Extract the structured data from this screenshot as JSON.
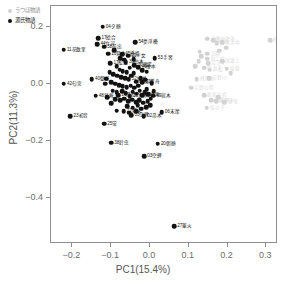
{
  "chart_data": {
    "type": "scatter",
    "title": "",
    "xlabel": "PC1(15.4%)",
    "ylabel": "PC2(11.3%)",
    "xlim": [
      -0.255,
      0.33
    ],
    "ylim": [
      -0.56,
      0.275
    ],
    "xticks": [
      -0.2,
      -0.1,
      0.0,
      0.1,
      0.2,
      0.3
    ],
    "xticklabels": [
      "−0.2",
      "−0.1",
      "0.0",
      "0.1",
      "0.2",
      "0.3"
    ],
    "yticks": [
      0.2,
      0.0,
      -0.2,
      -0.4
    ],
    "yticklabels": [
      "0.2",
      "0.0",
      "−0.2",
      "−0.4"
    ],
    "grid": false,
    "legend_position": "top-left",
    "series": [
      {
        "name": "うつほ物語",
        "color": "#d2d2d2",
        "marker": "circle",
        "points": [
          {
            "x": 0.148,
            "y": 0.16,
            "label": "内侍のかみ"
          },
          {
            "x": 0.163,
            "y": 0.155,
            "label": "楼の上上"
          },
          {
            "x": 0.172,
            "y": 0.145,
            "label": "楼の上中"
          },
          {
            "x": 0.186,
            "y": 0.148,
            "label": "吹上上"
          },
          {
            "x": 0.31,
            "y": 0.155,
            "label": "蔵開"
          },
          {
            "x": 0.148,
            "y": 0.108,
            "label": "正頥"
          },
          {
            "x": 0.148,
            "y": 0.09,
            "label": "吹上中"
          },
          {
            "x": 0.15,
            "y": 0.075,
            "label": "泣き子"
          },
          {
            "x": 0.186,
            "y": 0.082,
            "label": "国譲上"
          },
          {
            "x": 0.14,
            "y": 0.058,
            "label": "吹上下"
          },
          {
            "x": 0.154,
            "y": 0.052,
            "label": "浜松"
          },
          {
            "x": 0.198,
            "y": 0.055,
            "label": "俊蔭"
          },
          {
            "x": 0.12,
            "y": 0.018,
            "label": "蔵開上"
          },
          {
            "x": 0.152,
            "y": 0.022,
            "label": "吉野川"
          },
          {
            "x": 0.106,
            "y": -0.012,
            "label": "吉野の院"
          },
          {
            "x": 0.14,
            "y": -0.038,
            "label": "藤原の君"
          },
          {
            "x": 0.158,
            "y": -0.055,
            "label": "蔵開中"
          },
          {
            "x": 0.17,
            "y": -0.058,
            "label": "国譲下"
          },
          {
            "x": 0.192,
            "y": -0.062,
            "label": "継母"
          },
          {
            "x": 0.146,
            "y": -0.082,
            "label": "松の下"
          },
          {
            "x": 0.128,
            "y": 0.115,
            "label": ""
          },
          {
            "x": 0.132,
            "y": 0.098,
            "label": ""
          },
          {
            "x": 0.126,
            "y": 0.082,
            "label": ""
          },
          {
            "x": 0.116,
            "y": 0.064,
            "label": ""
          },
          {
            "x": 0.196,
            "y": 0.128,
            "label": ""
          },
          {
            "x": 0.178,
            "y": 0.118,
            "label": ""
          },
          {
            "x": 0.208,
            "y": 0.04,
            "label": ""
          },
          {
            "x": 0.176,
            "y": -0.044,
            "label": ""
          }
        ]
      },
      {
        "name": "源氏物語",
        "color": "#121212",
        "marker": "circle",
        "points": [
          {
            "x": -0.122,
            "y": 0.203,
            "label": "04夕顔",
            "pos": "right"
          },
          {
            "x": -0.133,
            "y": 0.163,
            "label": "17絵合",
            "pos": "right"
          },
          {
            "x": -0.136,
            "y": 0.14,
            "label": "44竹河",
            "pos": "right"
          },
          {
            "x": -0.118,
            "y": 0.132,
            "label": "58前出",
            "pos": "right"
          },
          {
            "x": -0.038,
            "y": 0.148,
            "label": "54夢浮橋",
            "pos": "right"
          },
          {
            "x": -0.222,
            "y": 0.122,
            "label": "11花散里",
            "pos": "right"
          },
          {
            "x": -0.108,
            "y": 0.108,
            "label": "10賢木",
            "pos": "right"
          },
          {
            "x": -0.072,
            "y": 0.105,
            "label": "45橋姫",
            "pos": "right"
          },
          {
            "x": -0.056,
            "y": 0.1,
            "label": "21少女",
            "pos": "right"
          },
          {
            "x": 0.012,
            "y": 0.092,
            "label": "53手習",
            "pos": "right"
          },
          {
            "x": -0.102,
            "y": 0.075,
            "label": "17松風",
            "pos": "right"
          },
          {
            "x": -0.062,
            "y": 0.078,
            "label": "36柏木",
            "pos": "right"
          },
          {
            "x": -0.04,
            "y": 0.068,
            "label": "30藤袋",
            "pos": "right"
          },
          {
            "x": -0.03,
            "y": 0.06,
            "label": "46椎本",
            "pos": "right"
          },
          {
            "x": -0.15,
            "y": 0.018,
            "label": "40御法",
            "pos": "right"
          },
          {
            "x": -0.222,
            "y": 0.002,
            "label": "42匂宮",
            "pos": "right"
          },
          {
            "x": -0.055,
            "y": 0.018,
            "label": "52蜗蛉",
            "pos": "right"
          },
          {
            "x": -0.036,
            "y": 0.01,
            "label": "08花宴",
            "pos": "right"
          },
          {
            "x": -0.02,
            "y": 0.008,
            "label": "51浮舟",
            "pos": "right"
          },
          {
            "x": -0.14,
            "y": -0.04,
            "label": "48早蕨",
            "pos": "right"
          },
          {
            "x": -0.082,
            "y": -0.038,
            "label": "14澄標",
            "pos": "right"
          },
          {
            "x": -0.052,
            "y": -0.042,
            "label": "31真木柱",
            "pos": "right"
          },
          {
            "x": -0.02,
            "y": -0.038,
            "label": "47総角",
            "pos": "right"
          },
          {
            "x": 0.008,
            "y": -0.04,
            "label": "49宿木",
            "pos": "right"
          },
          {
            "x": -0.205,
            "y": -0.112,
            "label": "23初音",
            "pos": "right"
          },
          {
            "x": -0.068,
            "y": -0.095,
            "label": "27篥火",
            "pos": "right"
          },
          {
            "x": -0.048,
            "y": -0.108,
            "label": "03空蝉",
            "pos": "right"
          },
          {
            "x": -0.016,
            "y": -0.112,
            "label": "02帚木",
            "pos": "right"
          },
          {
            "x": 0.03,
            "y": -0.098,
            "label": "06末摩",
            "pos": "right"
          },
          {
            "x": -0.118,
            "y": -0.138,
            "label": "25蛍",
            "pos": "right"
          },
          {
            "x": -0.1,
            "y": -0.205,
            "label": "38鈴虫",
            "pos": "right"
          },
          {
            "x": 0.02,
            "y": -0.208,
            "label": "20朝顔",
            "pos": "right"
          },
          {
            "x": -0.015,
            "y": -0.252,
            "label": "03空蝉",
            "pos": "right"
          },
          {
            "x": 0.062,
            "y": -0.498,
            "label": "27篥火",
            "pos": "right"
          },
          {
            "x": -0.092,
            "y": 0.12,
            "label": ""
          },
          {
            "x": -0.076,
            "y": 0.092,
            "label": ""
          },
          {
            "x": -0.066,
            "y": 0.086,
            "label": ""
          },
          {
            "x": -0.086,
            "y": 0.064,
            "label": ""
          },
          {
            "x": -0.078,
            "y": 0.052,
            "label": ""
          },
          {
            "x": -0.07,
            "y": 0.046,
            "label": ""
          },
          {
            "x": -0.06,
            "y": 0.042,
            "label": ""
          },
          {
            "x": -0.094,
            "y": 0.036,
            "label": ""
          },
          {
            "x": -0.084,
            "y": 0.03,
            "label": ""
          },
          {
            "x": -0.074,
            "y": 0.026,
            "label": ""
          },
          {
            "x": -0.064,
            "y": 0.022,
            "label": ""
          },
          {
            "x": -0.048,
            "y": 0.03,
            "label": ""
          },
          {
            "x": -0.042,
            "y": 0.04,
            "label": ""
          },
          {
            "x": -0.1,
            "y": 0.008,
            "label": ""
          },
          {
            "x": -0.09,
            "y": 0.002,
            "label": ""
          },
          {
            "x": -0.08,
            "y": -0.002,
            "label": ""
          },
          {
            "x": -0.07,
            "y": -0.006,
            "label": ""
          },
          {
            "x": -0.06,
            "y": -0.01,
            "label": ""
          },
          {
            "x": -0.05,
            "y": -0.004,
            "label": ""
          },
          {
            "x": -0.04,
            "y": -0.012,
            "label": ""
          },
          {
            "x": -0.03,
            "y": -0.004,
            "label": ""
          },
          {
            "x": -0.024,
            "y": 0.022,
            "label": ""
          },
          {
            "x": -0.012,
            "y": 0.016,
            "label": ""
          },
          {
            "x": -0.008,
            "y": -0.016,
            "label": ""
          },
          {
            "x": -0.096,
            "y": -0.022,
            "label": ""
          },
          {
            "x": -0.086,
            "y": -0.028,
            "label": ""
          },
          {
            "x": -0.072,
            "y": -0.024,
            "label": ""
          },
          {
            "x": -0.062,
            "y": -0.03,
            "label": ""
          },
          {
            "x": -0.044,
            "y": -0.026,
            "label": ""
          },
          {
            "x": -0.034,
            "y": -0.032,
            "label": ""
          },
          {
            "x": -0.026,
            "y": -0.022,
            "label": ""
          },
          {
            "x": -0.014,
            "y": -0.028,
            "label": ""
          },
          {
            "x": -0.004,
            "y": -0.034,
            "label": ""
          },
          {
            "x": -0.09,
            "y": -0.052,
            "label": ""
          },
          {
            "x": -0.076,
            "y": -0.056,
            "label": ""
          },
          {
            "x": -0.066,
            "y": -0.05,
            "label": ""
          },
          {
            "x": -0.056,
            "y": -0.06,
            "label": ""
          },
          {
            "x": -0.046,
            "y": -0.054,
            "label": ""
          },
          {
            "x": -0.036,
            "y": -0.062,
            "label": ""
          },
          {
            "x": -0.028,
            "y": -0.056,
            "label": ""
          },
          {
            "x": -0.018,
            "y": -0.064,
            "label": ""
          },
          {
            "x": -0.006,
            "y": -0.058,
            "label": ""
          },
          {
            "x": 0.002,
            "y": -0.05,
            "label": ""
          },
          {
            "x": -0.058,
            "y": -0.076,
            "label": ""
          },
          {
            "x": -0.044,
            "y": -0.082,
            "label": ""
          },
          {
            "x": -0.032,
            "y": -0.074,
            "label": ""
          },
          {
            "x": -0.022,
            "y": -0.086,
            "label": ""
          },
          {
            "x": -0.01,
            "y": -0.08,
            "label": ""
          },
          {
            "x": 0.0,
            "y": -0.072,
            "label": ""
          },
          {
            "x": -0.086,
            "y": -0.092,
            "label": ""
          },
          {
            "x": -0.1,
            "y": -0.066,
            "label": ""
          },
          {
            "x": -0.11,
            "y": -0.044,
            "label": ""
          },
          {
            "x": -0.104,
            "y": 0.042,
            "label": ""
          },
          {
            "x": -0.112,
            "y": 0.02,
            "label": ""
          },
          {
            "x": -0.052,
            "y": 0.058,
            "label": ""
          },
          {
            "x": -0.042,
            "y": 0.088,
            "label": ""
          },
          {
            "x": -0.02,
            "y": 0.05,
            "label": ""
          },
          {
            "x": -0.008,
            "y": 0.044,
            "label": ""
          },
          {
            "x": 0.004,
            "y": 0.004,
            "label": ""
          },
          {
            "x": 0.01,
            "y": -0.024,
            "label": ""
          },
          {
            "x": -0.116,
            "y": 0.002,
            "label": ""
          },
          {
            "x": -0.054,
            "y": -0.1,
            "label": ""
          },
          {
            "x": -0.036,
            "y": -0.094,
            "label": ""
          }
        ]
      }
    ]
  },
  "legend": {
    "items": [
      {
        "label": "うつほ物語",
        "color": "#d0d0d0"
      },
      {
        "label": "源氏物語",
        "color": "#121212"
      }
    ]
  }
}
